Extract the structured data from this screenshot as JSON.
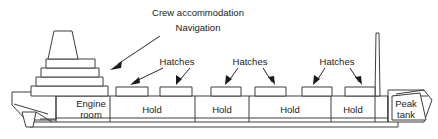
{
  "diagram": {
    "colors": {
      "stroke": "#3c3c3c",
      "text": "#1a1a1a",
      "background": "#ffffff",
      "arrow": "#1a1a1a"
    },
    "callouts": [
      {
        "id": "crew-accommodation",
        "label": "Crew accommodation",
        "x": 198,
        "y": 13
      },
      {
        "id": "navigation",
        "label": "Navigation",
        "x": 198,
        "y": 28
      },
      {
        "id": "hatches-1",
        "label": "Hatches",
        "x": 177,
        "y": 62
      },
      {
        "id": "hatches-2",
        "label": "Hatches",
        "x": 250,
        "y": 62
      },
      {
        "id": "hatches-3",
        "label": "Hatches",
        "x": 337,
        "y": 62
      }
    ],
    "compartments": [
      {
        "id": "engine-room",
        "lines": [
          "Engine",
          "room"
        ],
        "x": 91,
        "y": 110
      },
      {
        "id": "hold-1",
        "lines": [
          "Hold"
        ],
        "x": 152,
        "y": 110
      },
      {
        "id": "hold-2",
        "lines": [
          "Hold"
        ],
        "x": 222,
        "y": 110
      },
      {
        "id": "hold-3",
        "lines": [
          "Hold"
        ],
        "x": 290,
        "y": 110
      },
      {
        "id": "hold-4",
        "lines": [
          "Hold"
        ],
        "x": 353,
        "y": 110
      },
      {
        "id": "peak-tank",
        "lines": [
          "Peak",
          "tank"
        ],
        "x": 406,
        "y": 110
      }
    ],
    "hatches": [
      {
        "id": "hatch-1",
        "x": 116,
        "y": 87,
        "width": 32,
        "height": 9
      },
      {
        "id": "hatch-2",
        "x": 160,
        "y": 87,
        "width": 32,
        "height": 9
      },
      {
        "id": "hatch-3",
        "x": 211,
        "y": 87,
        "width": 30,
        "height": 9
      },
      {
        "id": "hatch-4",
        "x": 255,
        "y": 87,
        "width": 31,
        "height": 9
      },
      {
        "id": "hatch-5",
        "x": 302,
        "y": 87,
        "width": 30,
        "height": 9
      },
      {
        "id": "hatch-6",
        "x": 345,
        "y": 87,
        "width": 30,
        "height": 9
      }
    ],
    "structures": [
      {
        "id": "mast",
        "label": "Foremast"
      },
      {
        "id": "funnel",
        "label": "Funnel"
      },
      {
        "id": "superstructure",
        "label": "Superstructure deck tiers"
      },
      {
        "id": "stern",
        "label": "Stern with rudder and propeller"
      },
      {
        "id": "bow",
        "label": "Bow"
      },
      {
        "id": "double-bottom",
        "label": "Double bottom"
      }
    ]
  }
}
